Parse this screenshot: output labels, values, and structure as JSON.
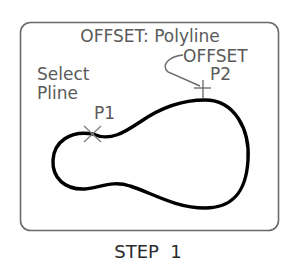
{
  "diagram": {
    "title": "OFFSET: Polyline",
    "labels": {
      "select": "Select",
      "pline": "Pline",
      "p1": "P1",
      "offset": "OFFSET",
      "p2": "P2"
    },
    "markers": {
      "p1_marker": "x-mark",
      "p2_marker": "cross-mark"
    },
    "caption": "STEP  1",
    "colors": {
      "frame": "#6a6a6a",
      "text": "#5a5a5a",
      "polyline": "#000000",
      "marker": "#808080"
    }
  }
}
